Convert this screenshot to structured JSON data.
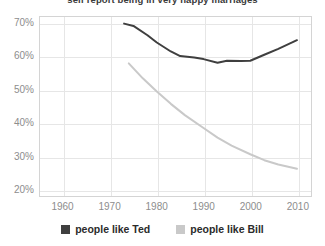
{
  "chart_data": {
    "type": "line",
    "title": "self report being in very happy marriages",
    "xlabel": "",
    "ylabel": "",
    "xlim": [
      1955,
      2013
    ],
    "ylim": [
      18,
      72
    ],
    "grid": true,
    "legend_position": "bottom-center",
    "x_ticks": [
      "1960",
      "1970",
      "1980",
      "1990",
      "2000",
      "2010"
    ],
    "x_tick_values": [
      1960,
      1970,
      1980,
      1990,
      2000,
      2010
    ],
    "y_ticks": [
      "20%",
      "30%",
      "40%",
      "50%",
      "60%",
      "70%"
    ],
    "y_tick_values": [
      20,
      30,
      40,
      50,
      60,
      70
    ],
    "series": [
      {
        "name": "people like Ted",
        "color": "#3f3f3f",
        "x": [
          1973,
          1975,
          1978,
          1980,
          1983,
          1985,
          1988,
          1990,
          1993,
          1995,
          1998,
          2000,
          2003,
          2006,
          2010
        ],
        "values": [
          70.0,
          69.3,
          66.5,
          64.3,
          61.6,
          60.2,
          59.8,
          59.3,
          58.2,
          58.8,
          58.7,
          58.8,
          60.6,
          62.4,
          65.0
        ]
      },
      {
        "name": "people like Bill",
        "color": "#c9c9c9",
        "x": [
          1974,
          1977,
          1980,
          1983,
          1986,
          1990,
          1993,
          1996,
          2000,
          2003,
          2006,
          2010
        ],
        "values": [
          58.0,
          53.5,
          49.5,
          45.8,
          42.4,
          38.5,
          35.6,
          33.2,
          30.6,
          28.8,
          27.5,
          26.2
        ]
      }
    ]
  },
  "legend": {
    "entries": [
      {
        "label": "people like Ted",
        "color": "#3f3f3f"
      },
      {
        "label": "people like Bill",
        "color": "#c9c9c9"
      }
    ]
  },
  "colors": {
    "series_dark": "#3f3f3f",
    "series_light": "#c9c9c9",
    "grid": "#e6e6e6",
    "frame": "#d4d4d4",
    "tick_text": "#8d8d8d",
    "title_text": "#3a3a3a",
    "legend_text": "#2b2b2b",
    "background": "#ffffff"
  }
}
